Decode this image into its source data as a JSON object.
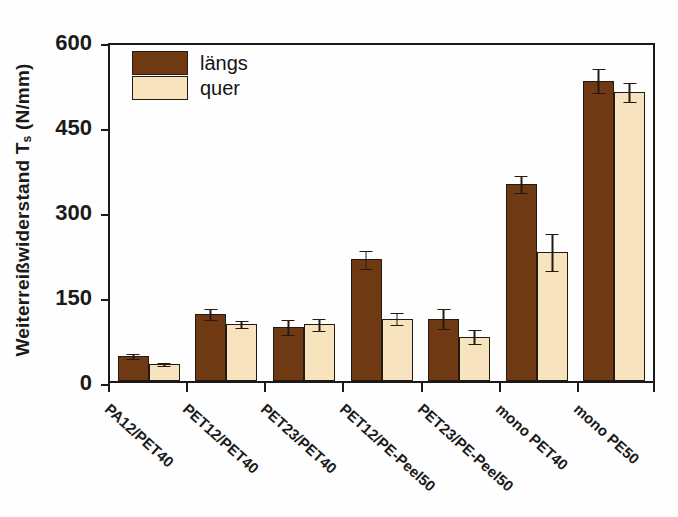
{
  "chart_data": {
    "type": "bar",
    "title": "",
    "xlabel": "",
    "ylabel": "Weiterreißwiderstand T",
    "ylabel_sub": "s",
    "ylabel_unit": " (N/mm)",
    "ylabel_full": "Weiterreißwiderstand Ts (N/mm)",
    "ylim": [
      0,
      600
    ],
    "yticks": [
      0,
      150,
      300,
      450,
      600
    ],
    "ytick_labels": [
      "0",
      "150",
      "300",
      "450",
      "600"
    ],
    "grid": false,
    "legend_position": "top-left",
    "categories": [
      "PA12/PET40",
      "PET12/PET40",
      "PET23/PET40",
      "PET12/PE-Peel50",
      "PET23/PE-Peel50",
      "mono PET40",
      "mono PE50"
    ],
    "series": [
      {
        "name": "längs",
        "color": "#6f3a13",
        "values": [
          44,
          118,
          96,
          215,
          110,
          348,
          530
        ],
        "errors": [
          6,
          11,
          14,
          17,
          19,
          16,
          22
        ]
      },
      {
        "name": "quer",
        "color": "#f7e3bd",
        "values": [
          30,
          100,
          100,
          110,
          78,
          228,
          510
        ],
        "errors": [
          3,
          7,
          11,
          12,
          13,
          33,
          17
        ]
      }
    ]
  },
  "legend": {
    "items": [
      {
        "label": "längs",
        "color": "#6f3a13"
      },
      {
        "label": "quer",
        "color": "#f7e3bd"
      }
    ]
  },
  "colors": {
    "laengs": "#6f3a13",
    "quer": "#f7e3bd",
    "axis": "#1a1a1a",
    "bar_outline": "#231a12",
    "background": "#fefefe"
  }
}
